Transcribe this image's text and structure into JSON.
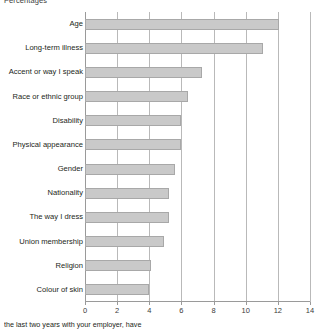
{
  "chart_data": {
    "type": "bar",
    "orientation": "horizontal",
    "title": "Percentages",
    "xlabel": "",
    "ylabel": "",
    "xlim": [
      0,
      14
    ],
    "xticks": [
      0,
      2,
      4,
      6,
      8,
      10,
      12,
      14
    ],
    "grid": true,
    "legend": null,
    "bar_color": "#c9c9c9",
    "bar_border_color": "#a8a8a8",
    "categories": [
      "Age",
      "Long-term illness",
      "Accent or way I speak",
      "Race or ethnic group",
      "Disability",
      "Physical appearance",
      "Gender",
      "Nationality",
      "The way I dress",
      "Union membership",
      "Religion",
      "Colour of skin"
    ],
    "values": [
      12.1,
      11.1,
      7.3,
      6.4,
      6.0,
      6.0,
      5.6,
      5.2,
      5.2,
      4.9,
      4.1,
      4.0
    ]
  },
  "footnote": {
    "text": "the last two years with your employer, have"
  }
}
